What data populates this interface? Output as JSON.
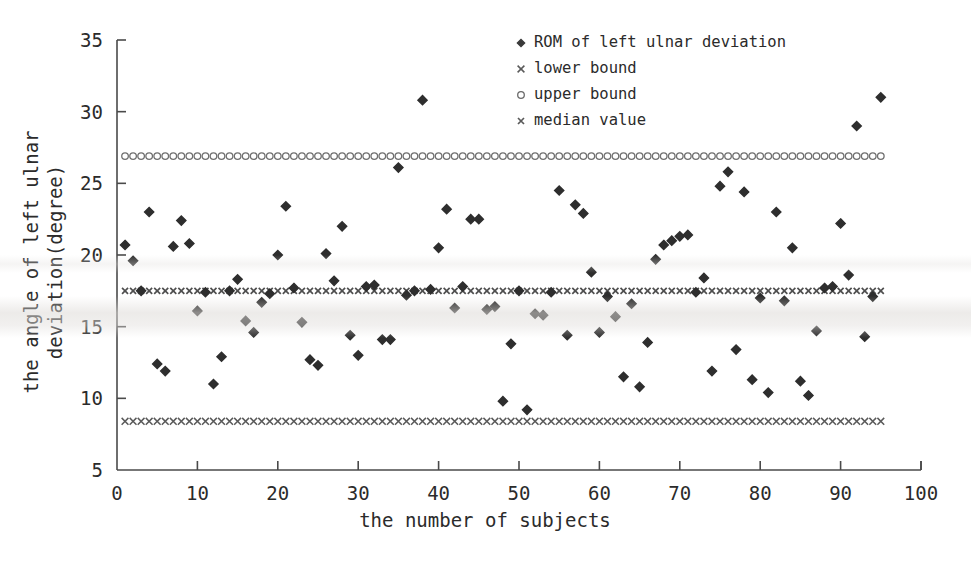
{
  "chart_data": {
    "type": "scatter",
    "title": "",
    "xlabel": "the number of subjects",
    "ylabel": "the angle of left ulnar deviation(degree)",
    "ylabel_line1": "the angle of left ulnar",
    "ylabel_line2": "deviation(degree)",
    "xlim": [
      0,
      100
    ],
    "ylim": [
      5,
      35
    ],
    "xticks": [
      0,
      10,
      20,
      30,
      40,
      50,
      60,
      70,
      80,
      90,
      100
    ],
    "yticks": [
      5,
      10,
      15,
      20,
      25,
      30,
      35
    ],
    "grid": false,
    "legend_position": "top-right",
    "legend": [
      {
        "label": "ROM of left ulnar deviation",
        "marker": "diamond",
        "color": "#3a3a3a"
      },
      {
        "label": "lower bound",
        "marker": "cross",
        "color": "#5a5a5a"
      },
      {
        "label": "upper bound",
        "marker": "circle",
        "color": "#6a6a6a"
      },
      {
        "label": "median value",
        "marker": "cross-small",
        "color": "#5a5a5a"
      }
    ],
    "reference_lines": {
      "upper_bound": 26.9,
      "median_value": 17.5,
      "lower_bound": 8.4,
      "x_start": 1,
      "x_end": 95
    },
    "series": [
      {
        "name": "ROM of left ulnar deviation",
        "marker": "diamond",
        "x": [
          1,
          2,
          3,
          4,
          5,
          6,
          7,
          8,
          9,
          10,
          11,
          12,
          13,
          14,
          15,
          16,
          17,
          18,
          19,
          20,
          21,
          22,
          23,
          24,
          25,
          26,
          27,
          28,
          29,
          30,
          31,
          32,
          33,
          34,
          35,
          36,
          37,
          38,
          39,
          40,
          41,
          42,
          43,
          44,
          45,
          46,
          47,
          48,
          49,
          50,
          51,
          52,
          53,
          54,
          55,
          56,
          57,
          58,
          59,
          60,
          61,
          62,
          63,
          64,
          65,
          66,
          67,
          68,
          69,
          70,
          71,
          72,
          73,
          74,
          75,
          76,
          77,
          78,
          79,
          80,
          81,
          82,
          83,
          84,
          85,
          86,
          87,
          88,
          89,
          90,
          91,
          92,
          93,
          94,
          95
        ],
        "y": [
          20.7,
          19.6,
          17.5,
          23.0,
          12.4,
          11.9,
          20.6,
          22.4,
          20.8,
          16.1,
          17.4,
          11.0,
          12.9,
          17.5,
          18.3,
          15.4,
          14.6,
          16.7,
          17.3,
          20.0,
          23.4,
          17.7,
          15.3,
          12.7,
          12.3,
          20.1,
          18.2,
          22.0,
          14.4,
          13.0,
          17.8,
          17.9,
          14.1,
          14.1,
          26.1,
          17.2,
          17.5,
          30.8,
          17.6,
          20.5,
          23.2,
          16.3,
          17.8,
          22.5,
          22.5,
          16.2,
          16.4,
          9.8,
          13.8,
          17.5,
          9.2,
          15.9,
          15.8,
          17.4,
          24.5,
          14.4,
          23.5,
          22.9,
          18.8,
          14.6,
          17.1,
          15.7,
          11.5,
          16.6,
          10.8,
          13.9,
          19.7,
          20.7,
          21.0,
          21.3,
          21.4,
          17.4,
          18.4,
          11.9,
          24.8,
          25.8,
          13.4,
          24.4,
          11.3,
          17.0,
          10.4,
          23.0,
          16.8,
          20.5,
          11.2,
          10.2,
          14.7,
          17.7,
          17.8,
          22.2,
          18.6,
          29.0,
          14.3,
          17.1,
          31.0
        ]
      }
    ]
  }
}
